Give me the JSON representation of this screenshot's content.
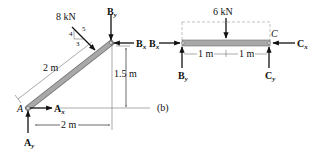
{
  "figure_label": "(b)",
  "left_member": {
    "point_label": "A",
    "load": {
      "value": "8 kN",
      "slope_rise": "4",
      "slope_run": "3",
      "slope_hyp": "5"
    },
    "length_label": "2 m",
    "height_label": "1.5 m",
    "span_label": "2 m",
    "forces": {
      "Ax": {
        "main": "A",
        "sub": "x"
      },
      "Ay": {
        "main": "A",
        "sub": "y"
      },
      "Bx": {
        "main": "B",
        "sub": "x"
      },
      "By": {
        "main": "B",
        "sub": "y"
      }
    }
  },
  "right_member": {
    "point_label": "C",
    "load": {
      "value": "6 kN"
    },
    "segment_labels": [
      "1 m",
      "1 m"
    ],
    "forces": {
      "Bx": {
        "main": "B",
        "sub": "x"
      },
      "By": {
        "main": "B",
        "sub": "y"
      },
      "Cx": {
        "main": "C",
        "sub": "x"
      },
      "Cy": {
        "main": "C",
        "sub": "y"
      }
    }
  },
  "colors": {
    "member_fill": "#a8a8a8",
    "member_edge": "#6e6e6e",
    "line": "#111111",
    "dim_line": "#555555",
    "dashed": "#999999"
  }
}
